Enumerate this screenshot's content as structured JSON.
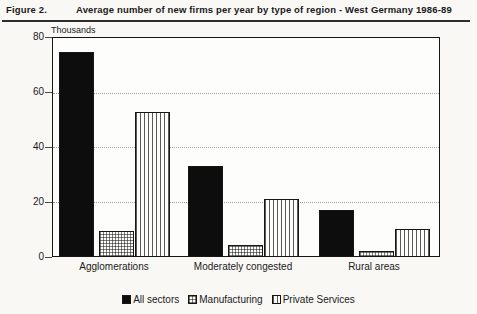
{
  "colors": {
    "ink": "#1a1a1a",
    "paper": "#f9f8f5",
    "gridline": "#9e9e9e",
    "bar_solid": "#0d0d0d"
  },
  "header": {
    "figure_label": "Figure 2.",
    "title": "Average number of new firms per year by type of region - West Germany 1986-89"
  },
  "chart_data": {
    "type": "bar",
    "title": "Average number of new firms per year by type of region - West Germany 1986-89",
    "unit_label": "Thousands",
    "categories": [
      "Agglomerations",
      "Moderately congested",
      "Rural areas"
    ],
    "series": [
      {
        "name": "All sectors",
        "pattern": "solid",
        "values": [
          75,
          33,
          17
        ]
      },
      {
        "name": "Manufacturing",
        "pattern": "crosshatch",
        "values": [
          9,
          4,
          2
        ]
      },
      {
        "name": "Private Services",
        "pattern": "vstripe",
        "values": [
          53,
          21,
          10
        ]
      }
    ],
    "ylim": [
      0,
      80
    ],
    "yticks": [
      0,
      20,
      40,
      60,
      80
    ],
    "grid_values": [
      20,
      40,
      60
    ],
    "grid_style": "dotted",
    "legend_position": "bottom"
  }
}
